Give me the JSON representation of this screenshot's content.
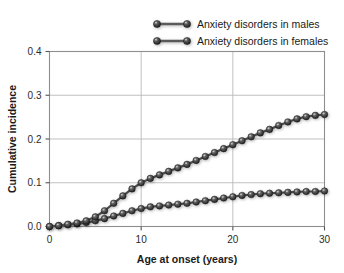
{
  "chart_data": {
    "type": "line",
    "title": "",
    "xlabel": "Age at onset (years)",
    "ylabel": "Cumulative incidence",
    "xlim": [
      0,
      30
    ],
    "ylim": [
      0.0,
      0.4
    ],
    "xticks": [
      0,
      10,
      20,
      30
    ],
    "xtick_labels": [
      "0",
      "10",
      "20",
      "30"
    ],
    "yticks": [
      0.0,
      0.1,
      0.2,
      0.3,
      0.4
    ],
    "ytick_labels": [
      "0.0",
      "0.1",
      "0.2",
      "0.3",
      "0.4"
    ],
    "grid": "horizontal-and-vertical",
    "legend_position": "top-right-outside",
    "marker": "sphere",
    "x": [
      0,
      1,
      2,
      3,
      4,
      5,
      6,
      7,
      8,
      9,
      10,
      11,
      12,
      13,
      14,
      15,
      16,
      17,
      18,
      19,
      20,
      21,
      22,
      23,
      24,
      25,
      26,
      27,
      28,
      29,
      30
    ],
    "series": [
      {
        "name": "Anxiety disorders in males",
        "color": "#3a3a3a",
        "values": [
          0.0,
          0.002,
          0.004,
          0.006,
          0.009,
          0.013,
          0.018,
          0.024,
          0.03,
          0.036,
          0.041,
          0.045,
          0.047,
          0.049,
          0.051,
          0.053,
          0.056,
          0.059,
          0.062,
          0.065,
          0.068,
          0.071,
          0.073,
          0.075,
          0.076,
          0.077,
          0.078,
          0.079,
          0.08,
          0.08,
          0.081
        ]
      },
      {
        "name": "Anxiety disorders in females",
        "color": "#3a3a3a",
        "values": [
          0.0,
          0.002,
          0.005,
          0.008,
          0.013,
          0.022,
          0.036,
          0.053,
          0.07,
          0.086,
          0.1,
          0.11,
          0.118,
          0.126,
          0.134,
          0.142,
          0.151,
          0.16,
          0.169,
          0.178,
          0.187,
          0.196,
          0.205,
          0.214,
          0.222,
          0.231,
          0.239,
          0.246,
          0.251,
          0.254,
          0.256
        ]
      }
    ]
  },
  "legend": {
    "entries": [
      {
        "label": "Anxiety disorders in males"
      },
      {
        "label": "Anxiety disorders in females"
      }
    ]
  }
}
